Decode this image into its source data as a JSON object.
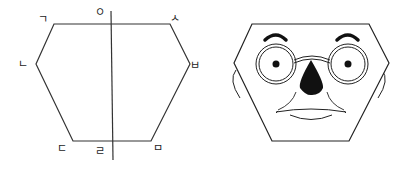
{
  "diagram": {
    "left_panel": {
      "title": "hexagon-outline-with-vertex-labels",
      "stroke_color": "#333333",
      "labels": {
        "top_left": "ㄱ",
        "top_center": "ㅇ",
        "top_right": "ㅅ",
        "mid_left": "ㄴ",
        "mid_right": "ㅂ",
        "bottom_left": "ㄷ",
        "bottom_center": "ㄹ",
        "bottom_right": "ㅁ"
      }
    },
    "right_panel": {
      "title": "hexagon-face-with-glasses",
      "stroke_color": "#222222",
      "features": [
        "eyebrows",
        "round-glasses",
        "eyes",
        "nose",
        "mouth",
        "ears"
      ]
    }
  }
}
